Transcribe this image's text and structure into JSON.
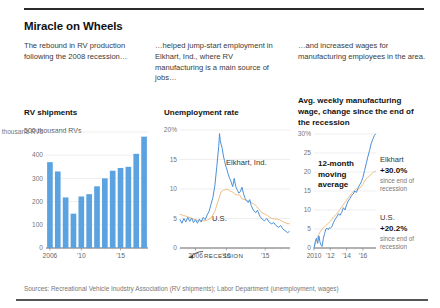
{
  "graphic": {
    "title": "Miracle on Wheels",
    "source": "Sources: Recreational Vehicle Inudstry Association (RV shipments); Labor Department (unemployment, wages)",
    "decks": [
      "The rebound in RV production following the 2008 recession…",
      "…helped jump-start employment in Elkhart, Ind., where RV manufacturing is a main source of jobs…",
      "…and increased wages for manufacturing employees in the area."
    ]
  },
  "colors": {
    "blue": "#5BA3E0",
    "blue_line": "#4A90D9",
    "tan": "#EEBE85",
    "axis": "#999999",
    "grid": "#E2E2E2",
    "text": "#1A1A1A"
  },
  "chart_data": [
    {
      "id": "rv-shipments",
      "type": "bar",
      "title": "RV shipments",
      "subtitle": "500 thousand RVs",
      "xlabel": "",
      "ylabel": "thousand RVs",
      "ylim": [
        0,
        500
      ],
      "yticks": [
        0,
        100,
        200,
        300,
        400,
        500
      ],
      "ytick_labels": [
        "0",
        "100",
        "200",
        "300",
        "400",
        "500 thousand RVs"
      ],
      "grid": true,
      "legend_position": "none",
      "categories": [
        "2006",
        "2007",
        "2008",
        "2009",
        "2010",
        "2011",
        "2012",
        "2013",
        "2014",
        "2015",
        "2016",
        "2017",
        "2018"
      ],
      "xtick_labels": [
        "2006",
        "'10",
        "'15"
      ],
      "xtick_categories": [
        "2006",
        "2010",
        "2015"
      ],
      "values": [
        370,
        330,
        218,
        148,
        222,
        232,
        266,
        300,
        333,
        345,
        350,
        406,
        480
      ]
    },
    {
      "id": "unemployment-rate",
      "type": "line",
      "title": "Unemployment rate",
      "subtitle": "",
      "xlabel": "",
      "ylabel": "%",
      "ylim": [
        0,
        20
      ],
      "yticks": [
        0,
        5,
        10,
        15,
        20
      ],
      "ytick_labels": [
        "0",
        "5",
        "10",
        "15",
        "20%"
      ],
      "grid": true,
      "legend_position": "inline",
      "xlim": [
        2004.0,
        2018.2
      ],
      "xtick_labels": [
        "2006",
        "'10",
        "'15"
      ],
      "xticks": [
        2006,
        2010,
        2015
      ],
      "annotations": [
        {
          "text": "Elkhart, Ind.",
          "series": "Elkhart, Ind."
        },
        {
          "text": "U.S.",
          "series": "U.S."
        },
        {
          "text": "RECESSION",
          "kind": "marker"
        }
      ],
      "series": [
        {
          "name": "Elkhart, Ind.",
          "color": "#4A90D9",
          "x": [
            2004.0,
            2004.25,
            2004.5,
            2004.75,
            2005.0,
            2005.25,
            2005.5,
            2005.75,
            2006.0,
            2006.25,
            2006.5,
            2006.75,
            2007.0,
            2007.25,
            2007.5,
            2007.75,
            2008.0,
            2008.25,
            2008.5,
            2008.75,
            2009.0,
            2009.1,
            2009.2,
            2009.3,
            2009.45,
            2009.6,
            2009.75,
            2009.9,
            2010.0,
            2010.2,
            2010.4,
            2010.6,
            2010.8,
            2011.0,
            2011.2,
            2011.4,
            2011.6,
            2011.8,
            2012.0,
            2012.2,
            2012.4,
            2012.6,
            2012.8,
            2013.0,
            2013.2,
            2013.4,
            2013.6,
            2013.8,
            2014.0,
            2014.3,
            2014.6,
            2014.9,
            2015.2,
            2015.5,
            2015.8,
            2016.1,
            2016.4,
            2016.7,
            2017.0,
            2017.3,
            2017.6,
            2017.9,
            2018.1
          ],
          "y": [
            4.8,
            4.2,
            5.0,
            4.4,
            5.2,
            4.5,
            5.1,
            4.3,
            4.8,
            4.2,
            4.9,
            4.4,
            5.2,
            4.8,
            5.6,
            6.2,
            7.4,
            8.6,
            10.6,
            13.8,
            17.2,
            19.4,
            18.2,
            17.6,
            16.9,
            15.6,
            14.8,
            13.9,
            13.6,
            12.6,
            11.8,
            11.2,
            10.4,
            11.8,
            10.4,
            9.8,
            9.3,
            9.6,
            10.3,
            9.2,
            8.4,
            8.0,
            7.7,
            8.2,
            7.2,
            6.6,
            6.2,
            6.0,
            6.4,
            5.4,
            4.9,
            4.6,
            5.0,
            4.4,
            4.1,
            4.3,
            3.8,
            3.5,
            3.8,
            3.2,
            2.9,
            2.6,
            2.8
          ]
        },
        {
          "name": "U.S.",
          "color": "#EEBE85",
          "x": [
            2004.0,
            2004.5,
            2005.0,
            2005.5,
            2006.0,
            2006.5,
            2007.0,
            2007.5,
            2008.0,
            2008.5,
            2009.0,
            2009.3,
            2009.6,
            2009.9,
            2010.2,
            2010.5,
            2010.8,
            2011.1,
            2011.4,
            2011.7,
            2012.0,
            2012.3,
            2012.6,
            2012.9,
            2013.2,
            2013.5,
            2013.8,
            2014.1,
            2014.4,
            2014.7,
            2015.0,
            2015.3,
            2015.6,
            2015.9,
            2016.2,
            2016.5,
            2016.8,
            2017.1,
            2017.4,
            2017.7,
            2018.1
          ],
          "y": [
            5.7,
            5.5,
            5.3,
            5.0,
            4.8,
            4.6,
            4.6,
            4.7,
            5.1,
            6.2,
            8.3,
            9.5,
            9.8,
            9.9,
            9.9,
            9.6,
            9.5,
            9.1,
            9.0,
            9.0,
            8.3,
            8.2,
            8.1,
            7.9,
            7.7,
            7.5,
            7.2,
            6.7,
            6.2,
            5.9,
            5.7,
            5.5,
            5.2,
            5.0,
            4.9,
            4.9,
            4.8,
            4.6,
            4.4,
            4.2,
            4.1
          ]
        }
      ]
    },
    {
      "id": "manufacturing-wage-change",
      "type": "line",
      "title": "Avg. weekly manufacturing wage, change since the end of the recession",
      "subtitle": "",
      "xlabel": "",
      "ylabel": "%",
      "ylim": [
        0,
        30
      ],
      "yticks": [
        0,
        5,
        10,
        15,
        20,
        25,
        30
      ],
      "ytick_labels": [
        "0",
        "5",
        "10",
        "15",
        "20",
        "25",
        "30%"
      ],
      "grid": true,
      "legend_position": "right-inline",
      "xlim": [
        2010.0,
        2017.6
      ],
      "xtick_labels": [
        "2010",
        "'12",
        "'14",
        "'16"
      ],
      "xticks": [
        2010,
        2012,
        2014,
        2016
      ],
      "annotations": [
        {
          "text": "12-month moving average",
          "kind": "note"
        },
        {
          "series": "Elkhart",
          "name": "Elkhart",
          "value": "+30.0%",
          "note": "since end of recession"
        },
        {
          "series": "U.S.",
          "name": "U.S.",
          "value": "+20.2%",
          "note": "since end of recession"
        }
      ],
      "series": [
        {
          "name": "Elkhart",
          "color": "#4A90D9",
          "x": [
            2010.0,
            2010.15,
            2010.3,
            2010.45,
            2010.6,
            2010.75,
            2010.9,
            2011.0,
            2011.15,
            2011.3,
            2011.45,
            2011.6,
            2011.75,
            2011.9,
            2012.0,
            2012.2,
            2012.4,
            2012.6,
            2012.8,
            2013.0,
            2013.2,
            2013.4,
            2013.6,
            2013.8,
            2014.0,
            2014.2,
            2014.4,
            2014.6,
            2014.8,
            2015.0,
            2015.2,
            2015.4,
            2015.6,
            2015.8,
            2016.0,
            2016.2,
            2016.4,
            2016.6,
            2016.8,
            2017.0,
            2017.2,
            2017.4,
            2017.55
          ],
          "y": [
            0.0,
            1.6,
            2.6,
            1.2,
            3.2,
            1.4,
            0.6,
            0.4,
            2.6,
            3.8,
            5.0,
            5.2,
            4.8,
            5.4,
            5.2,
            5.6,
            6.8,
            7.6,
            8.2,
            9.0,
            8.6,
            9.4,
            10.6,
            10.0,
            11.4,
            12.4,
            13.0,
            13.8,
            14.2,
            15.0,
            14.6,
            15.8,
            16.6,
            17.4,
            18.6,
            20.4,
            22.2,
            24.0,
            25.6,
            27.4,
            28.6,
            29.6,
            30.0
          ]
        },
        {
          "name": "U.S.",
          "color": "#EEBE85",
          "x": [
            2010.0,
            2010.2,
            2010.4,
            2010.6,
            2010.8,
            2011.0,
            2011.2,
            2011.4,
            2011.6,
            2011.8,
            2012.0,
            2012.2,
            2012.4,
            2012.6,
            2012.8,
            2013.0,
            2013.2,
            2013.4,
            2013.6,
            2013.8,
            2014.0,
            2014.2,
            2014.4,
            2014.6,
            2014.8,
            2015.0,
            2015.2,
            2015.4,
            2015.6,
            2015.8,
            2016.0,
            2016.2,
            2016.4,
            2016.6,
            2016.8,
            2017.0,
            2017.2,
            2017.4,
            2017.55
          ],
          "y": [
            0.0,
            1.4,
            2.6,
            3.6,
            4.4,
            5.0,
            5.4,
            5.8,
            6.2,
            6.6,
            7.0,
            7.6,
            8.2,
            8.6,
            9.0,
            9.6,
            10.2,
            10.8,
            11.4,
            12.0,
            12.6,
            13.2,
            13.8,
            14.4,
            14.8,
            15.2,
            15.6,
            15.4,
            15.8,
            16.2,
            16.8,
            17.6,
            18.2,
            18.6,
            19.0,
            19.4,
            19.8,
            20.1,
            20.2
          ]
        }
      ]
    }
  ]
}
